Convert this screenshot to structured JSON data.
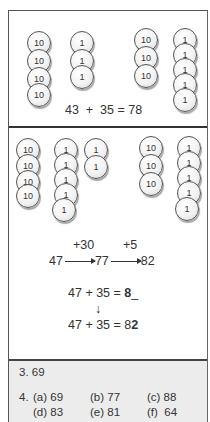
{
  "panel1": {
    "group_a": {
      "tens": [
        "10",
        "10",
        "10",
        "10"
      ],
      "ones": [
        "1",
        "1",
        "1"
      ]
    },
    "group_b": {
      "tens": [
        "10",
        "10",
        "10"
      ],
      "ones": [
        "1",
        "1",
        "1",
        "1",
        "1"
      ]
    },
    "equation": "43  +  35 = 78"
  },
  "panel2": {
    "group_a": {
      "tens": [
        "10",
        "10",
        "10",
        "10"
      ],
      "ones_col1": [
        "1",
        "1",
        "1",
        "1",
        "1"
      ],
      "ones_col2": [
        "1",
        "1"
      ]
    },
    "group_b": {
      "tens": [
        "10",
        "10",
        "10"
      ],
      "ones": [
        "1",
        "1",
        "1",
        "1",
        "1"
      ]
    },
    "number_line": {
      "step1_label": "+30",
      "step2_label": "+5",
      "start": "47",
      "mid": "77",
      "end": "82"
    },
    "eq1_prefix": "47 + 35 = ",
    "eq1_bold": "8",
    "eq1_suffix": "_",
    "down_arrow": "↓",
    "eq2_prefix": "47 + 35 = 8",
    "eq2_bold": "2"
  },
  "answers": {
    "q3": "3. 69",
    "q4_label": "4.",
    "items": [
      {
        "label": "(a) 69"
      },
      {
        "label": "(b) 77"
      },
      {
        "label": "(c) 88"
      },
      {
        "label": "(d) 83"
      },
      {
        "label": "(e) 81"
      },
      {
        "label": "(f)  64"
      }
    ]
  }
}
